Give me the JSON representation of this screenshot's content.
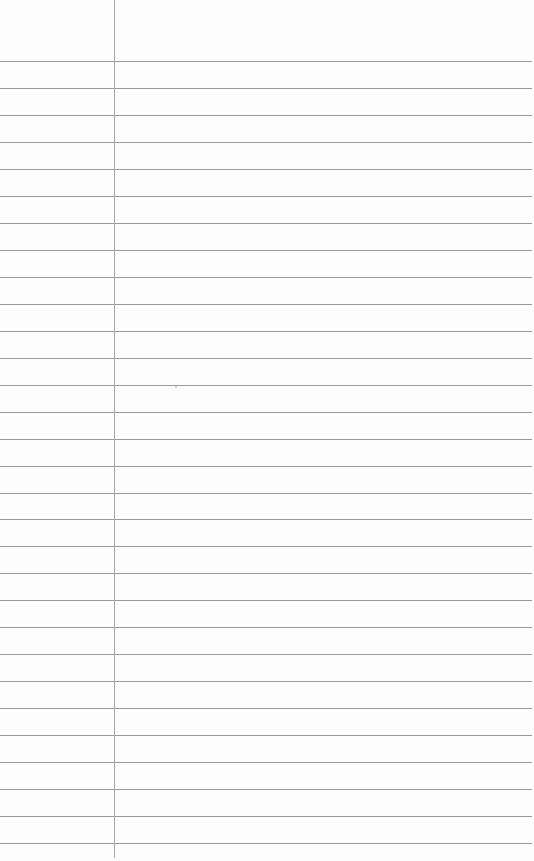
{
  "paper": {
    "type": "lined-notebook-page",
    "background": "#fdfdfd",
    "rule_color": "#9a9a9a",
    "margin_color": "#a8a8a8",
    "rule_count": 30,
    "first_rule_y": 61,
    "rule_spacing": 26.97,
    "margin_x": 114
  }
}
